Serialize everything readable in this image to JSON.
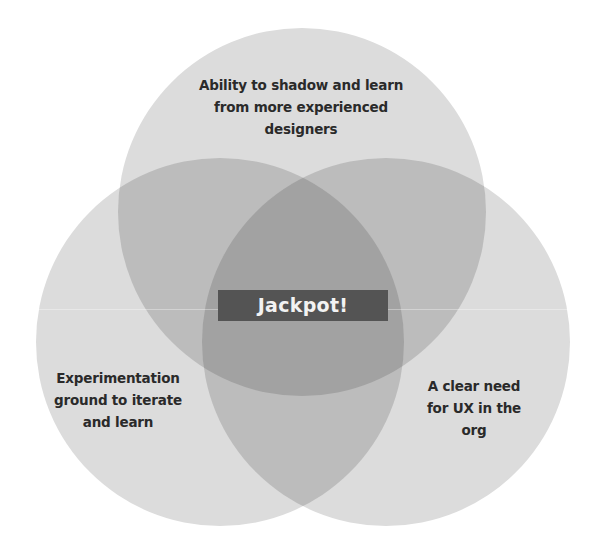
{
  "diagram": {
    "type": "venn",
    "sets": [
      {
        "id": "top",
        "label": "Ability to shadow and learn from more experienced designers"
      },
      {
        "id": "left",
        "label": "Experimentation ground to iterate and learn"
      },
      {
        "id": "right",
        "label": "A clear need for UX in the org"
      }
    ],
    "center_label": "Jackpot!",
    "colors": {
      "single": "#dcdcdc",
      "double": "#bcbcbc",
      "triple": "#a2a2a2",
      "center_box": "#545454",
      "center_text": "#f2f2f2",
      "text": "#2a2a2a"
    }
  },
  "labels": {
    "top_lines": [
      "Ability to shadow and learn",
      "from more experienced",
      "designers"
    ],
    "left_lines": [
      "Experimentation",
      "ground to iterate",
      "and learn"
    ],
    "right_lines": [
      "A clear need",
      "for UX in the",
      "org"
    ]
  }
}
